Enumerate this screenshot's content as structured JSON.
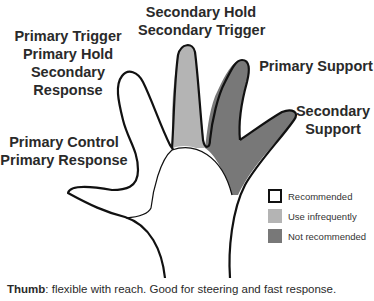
{
  "diagram": {
    "type": "hand-finger-role-map",
    "colors": {
      "recommended": "#ffffff",
      "use_infrequently": "#b4b4b4",
      "not_recommended": "#787878",
      "outline": "#111111"
    },
    "fingers": {
      "index": {
        "lines": [
          "Primary Trigger",
          "Primary Hold",
          "Secondary",
          "Response"
        ],
        "status": "recommended"
      },
      "middle": {
        "lines": [
          "Secondary Hold",
          "Secondary Trigger"
        ],
        "status": "use_infrequently"
      },
      "ring": {
        "lines": [
          "Primary Support"
        ],
        "status": "not_recommended"
      },
      "pinky": {
        "lines": [
          "Secondary",
          "Support"
        ],
        "status": "not_recommended"
      },
      "thumb": {
        "lines": [
          "Primary Control",
          "Primary Response"
        ],
        "status": "recommended"
      }
    }
  },
  "legend": {
    "items": [
      {
        "label": "Recommended",
        "color": "#ffffff",
        "border": "#111111"
      },
      {
        "label": "Use infrequently",
        "color": "#b4b4b4"
      },
      {
        "label": "Not recommended",
        "color": "#787878"
      }
    ]
  },
  "footer": {
    "bold": "Thumb",
    "text": ": flexible with reach. Good for steering and fast response."
  }
}
